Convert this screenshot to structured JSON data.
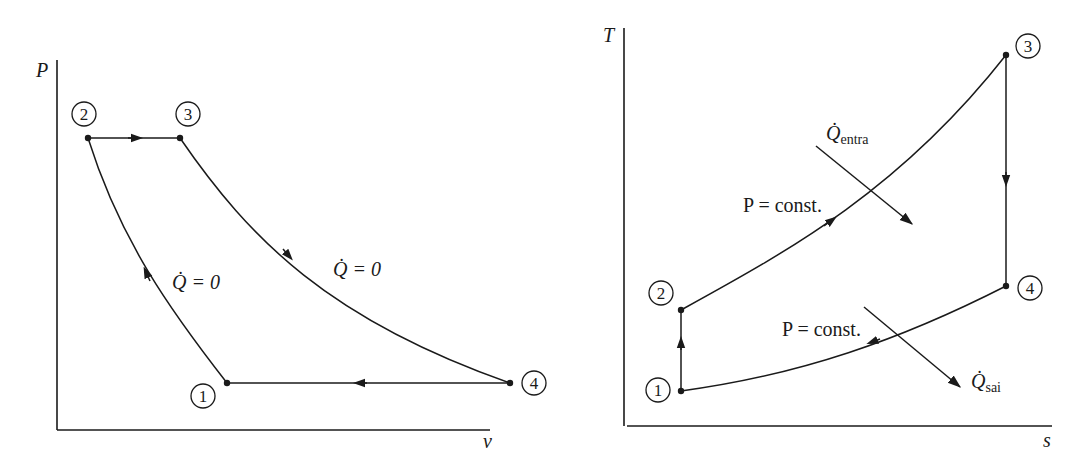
{
  "figure": {
    "left_diagram": {
      "name": "P-v diagram",
      "axes": {
        "y_label": "P",
        "x_label": "v"
      },
      "states": [
        "1",
        "2",
        "3",
        "4"
      ],
      "labels": {
        "q_left": "Q̇ = 0",
        "q_right": "Q̇ = 0"
      }
    },
    "right_diagram": {
      "name": "T-s diagram",
      "axes": {
        "y_label": "T",
        "x_label": "s"
      },
      "states": [
        "1",
        "2",
        "3",
        "4"
      ],
      "labels": {
        "p_const_upper": "P = const.",
        "p_const_lower": "P = const.",
        "q_in_base": "Q̇",
        "q_in_sub": "entra",
        "q_out_base": "Q̇",
        "q_out_sub": "sai"
      }
    }
  },
  "colors": {
    "ink": "#1a1a1a",
    "background": "#ffffff"
  }
}
